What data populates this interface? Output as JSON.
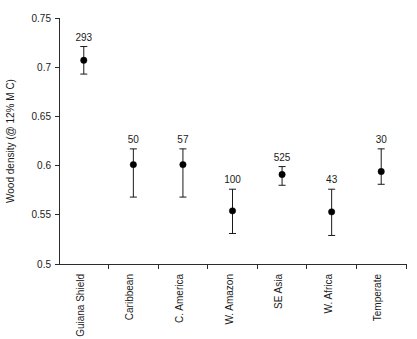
{
  "chart_data": {
    "type": "scatter",
    "title": "",
    "xlabel": "",
    "ylabel": "Wood density (@ 12% M C)",
    "ylim": [
      0.5,
      0.75
    ],
    "yticks": [
      "0.5",
      "0.55",
      "0.6",
      "0.65",
      "0.7",
      "0.75"
    ],
    "ytick_values": [
      0.5,
      0.55,
      0.6,
      0.65,
      0.7,
      0.75
    ],
    "grid": false,
    "legend": "none",
    "error_bar_style": "vertical-line-with-caps",
    "categories": [
      "Guiana Shield",
      "Caribbean",
      "C. America",
      "W. Amazon",
      "SE Asia",
      "W. Africa",
      "Temperate"
    ],
    "values": [
      0.707,
      0.601,
      0.601,
      0.554,
      0.591,
      0.553,
      0.594
    ],
    "error_low": [
      0.693,
      0.568,
      0.568,
      0.531,
      0.58,
      0.529,
      0.581
    ],
    "error_high": [
      0.721,
      0.617,
      0.617,
      0.576,
      0.599,
      0.576,
      0.617
    ],
    "point_labels": [
      "293",
      "50",
      "57",
      "100",
      "525",
      "43",
      "30"
    ],
    "point_label_meaning": "sample count n",
    "series": [
      {
        "name": "Wood density mean with error bars",
        "points": [
          {
            "category": "Guiana Shield",
            "value": 0.707,
            "low": 0.693,
            "high": 0.721,
            "n": "293"
          },
          {
            "category": "Caribbean",
            "value": 0.601,
            "low": 0.568,
            "high": 0.617,
            "n": "50"
          },
          {
            "category": "C. America",
            "value": 0.601,
            "low": 0.568,
            "high": 0.617,
            "n": "57"
          },
          {
            "category": "W. Amazon",
            "value": 0.554,
            "low": 0.531,
            "high": 0.576,
            "n": "100"
          },
          {
            "category": "SE Asia",
            "value": 0.591,
            "low": 0.58,
            "high": 0.599,
            "n": "525"
          },
          {
            "category": "W. Africa",
            "value": 0.553,
            "low": 0.529,
            "high": 0.576,
            "n": "43"
          },
          {
            "category": "Temperate",
            "value": 0.594,
            "low": 0.581,
            "high": 0.617,
            "n": "30"
          }
        ]
      }
    ],
    "colors": {
      "marker": "#000000",
      "error_bar": "#1a1a1a",
      "axis": "#2b2b2b",
      "text": "#1a1a1a",
      "background": "#ffffff"
    }
  }
}
